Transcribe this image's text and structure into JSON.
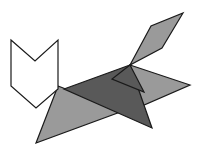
{
  "figure": {
    "canvas": {
      "width": 198,
      "height": 156,
      "background": "#ffffff"
    },
    "palette": {
      "white_fill": "#ffffff",
      "light_gray_fill": "#9a9a9a",
      "mid_gray_fill": "#808080",
      "dark_gray_fill": "#595959",
      "outline": "#1a1a1a"
    },
    "pieces": [
      {
        "id": "piece-white-chevron",
        "label": "White chevron head piece",
        "fill": "#ffffff",
        "points": "11,40 35,61 58,40 58,89 36,108 11,86"
      },
      {
        "id": "piece-gray-parallelogram",
        "label": "Light gray parallelogram tail piece",
        "fill": "#9a9a9a",
        "points": "183,13 162,48 130,65 151,26"
      },
      {
        "id": "piece-gray-left-triangle",
        "label": "Light gray large left leg triangle",
        "fill": "#9a9a9a",
        "points": "58,86 123,111 36,143"
      },
      {
        "id": "piece-gray-right-triangle",
        "label": "Light gray right body triangle",
        "fill": "#9a9a9a",
        "points": "130,65 190,85 128,112"
      },
      {
        "id": "piece-dark-body-triangle",
        "label": "Dark gray central body triangle",
        "fill": "#595959",
        "points": "130,65 152,128 64,89"
      },
      {
        "id": "piece-dark-upper-wedge",
        "label": "Dark gray upper wedge between tail and body",
        "fill": "#595959",
        "points": "130,65 144,92 112,79"
      }
    ]
  }
}
